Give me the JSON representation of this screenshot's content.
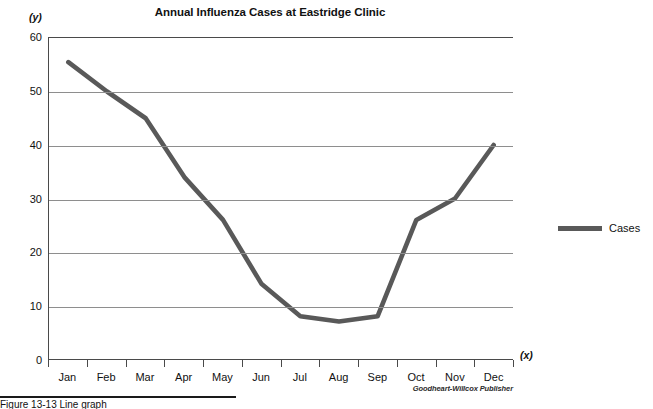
{
  "title": "Annual Influenza Cases at Eastridge Clinic",
  "axis_names": {
    "y": "(y)",
    "x": "(x)"
  },
  "legend": {
    "label": "Cases",
    "color": "#595959"
  },
  "credit": "Goodheart-Willcox Publisher",
  "caption": "Figure 13-13  Line graph",
  "chart_data": {
    "type": "line",
    "title": "Annual Influenza Cases at Eastridge Clinic",
    "xlabel": "(x)",
    "ylabel": "(y)",
    "categories": [
      "Jan",
      "Feb",
      "Mar",
      "Apr",
      "May",
      "Jun",
      "Jul",
      "Aug",
      "Sep",
      "Oct",
      "Nov",
      "Dec"
    ],
    "series": [
      {
        "name": "Cases",
        "color": "#595959",
        "values": [
          55.5,
          50,
          45,
          34,
          26,
          14,
          8,
          7,
          8,
          26,
          30,
          40
        ]
      }
    ],
    "ylim": [
      0,
      60
    ],
    "yticks": [
      0,
      10,
      20,
      30,
      40,
      50,
      60
    ],
    "grid": true,
    "grid_axis": "y",
    "legend_position": "right"
  }
}
